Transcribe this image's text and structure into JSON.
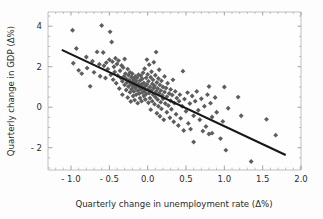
{
  "chart_data": {
    "type": "scatter",
    "title": "",
    "xlabel": "Quarterly change in unemployment rate (Δ%)",
    "ylabel": "Quarterly change in GDP (Δ%)",
    "xlim": [
      -1.3,
      2.0
    ],
    "ylim": [
      -3.1,
      4.7
    ],
    "grid": false,
    "legend": null,
    "xticks": [
      -1.0,
      -0.5,
      0.0,
      0.5,
      1.0,
      1.5,
      2.0
    ],
    "xtick_labels": [
      "- 1.0",
      "- 0.5",
      "0.0",
      "0.5",
      "1.0",
      "1.5",
      "2.0"
    ],
    "yticks": [
      -2,
      0,
      2,
      4
    ],
    "ytick_labels": [
      "- 2",
      "0",
      "2",
      "4"
    ],
    "marker_shape": "diamond",
    "marker_color": "#5d5d5d",
    "trendline": {
      "color": "#171717",
      "x1": -1.12,
      "y1": 2.83,
      "x2": 1.8,
      "y2": -2.36
    },
    "points": [
      [
        -0.98,
        3.8
      ],
      [
        -0.93,
        2.9
      ],
      [
        -0.97,
        2.17
      ],
      [
        -0.9,
        1.82
      ],
      [
        -0.86,
        1.66
      ],
      [
        -0.8,
        2.48
      ],
      [
        -0.79,
        1.93
      ],
      [
        -0.75,
        1.03
      ],
      [
        -0.72,
        2.27
      ],
      [
        -0.7,
        1.72
      ],
      [
        -0.66,
        2.73
      ],
      [
        -0.63,
        2.12
      ],
      [
        -0.62,
        1.53
      ],
      [
        -0.6,
        4.03
      ],
      [
        -0.58,
        2.7
      ],
      [
        -0.57,
        2.05
      ],
      [
        -0.55,
        1.44
      ],
      [
        -0.54,
        2.2
      ],
      [
        -0.52,
        1.88
      ],
      [
        -0.5,
        2.34
      ],
      [
        -0.49,
        3.72
      ],
      [
        -0.48,
        1.6
      ],
      [
        -0.47,
        3.22
      ],
      [
        -0.46,
        2.25
      ],
      [
        -0.45,
        1.36
      ],
      [
        -0.44,
        2.0
      ],
      [
        -0.43,
        1.74
      ],
      [
        -0.42,
        2.42
      ],
      [
        -0.41,
        1.18
      ],
      [
        -0.4,
        2.13
      ],
      [
        -0.39,
        1.57
      ],
      [
        -0.38,
        2.3
      ],
      [
        -0.37,
        0.92
      ],
      [
        -0.36,
        1.8
      ],
      [
        -0.35,
        1.45
      ],
      [
        -0.34,
        2.06
      ],
      [
        -0.33,
        1.28
      ],
      [
        -0.33,
        0.62
      ],
      [
        -0.32,
        1.96
      ],
      [
        -0.31,
        1.52
      ],
      [
        -0.3,
        1.1
      ],
      [
        -0.3,
        2.38
      ],
      [
        -0.29,
        1.66
      ],
      [
        -0.28,
        0.85
      ],
      [
        -0.28,
        1.4
      ],
      [
        -0.27,
        1.22
      ],
      [
        -0.26,
        1.88
      ],
      [
        -0.26,
        0.48
      ],
      [
        -0.25,
        1.58
      ],
      [
        -0.25,
        1.02
      ],
      [
        -0.24,
        1.33
      ],
      [
        -0.23,
        0.74
      ],
      [
        -0.23,
        1.72
      ],
      [
        -0.22,
        1.14
      ],
      [
        -0.22,
        0.28
      ],
      [
        -0.21,
        1.48
      ],
      [
        -0.21,
        0.9
      ],
      [
        -0.2,
        1.25
      ],
      [
        -0.2,
        1.65
      ],
      [
        -0.19,
        0.55
      ],
      [
        -0.19,
        1.05
      ],
      [
        -0.18,
        1.38
      ],
      [
        -0.18,
        0.78
      ],
      [
        -0.17,
        1.18
      ],
      [
        -0.17,
        0.35
      ],
      [
        -0.16,
        1.52
      ],
      [
        -0.16,
        0.95
      ],
      [
        -0.15,
        1.28
      ],
      [
        -0.15,
        0.62
      ],
      [
        -0.14,
        1.08
      ],
      [
        -0.14,
        1.45
      ],
      [
        -0.13,
        0.82
      ],
      [
        -0.13,
        0.2
      ],
      [
        -0.12,
        1.15
      ],
      [
        -0.12,
        1.6
      ],
      [
        -0.11,
        0.68
      ],
      [
        -0.11,
        1.0
      ],
      [
        -0.1,
        1.32
      ],
      [
        -0.1,
        0.45
      ],
      [
        -0.09,
        0.88
      ],
      [
        -0.09,
        1.55
      ],
      [
        -0.08,
        1.12
      ],
      [
        -0.08,
        0.3
      ],
      [
        -0.07,
        0.72
      ],
      [
        -0.07,
        1.4
      ],
      [
        -0.06,
        0.96
      ],
      [
        -0.06,
        1.7
      ],
      [
        -0.05,
        0.55
      ],
      [
        -0.05,
        1.2
      ],
      [
        -0.04,
        0.8
      ],
      [
        -0.04,
        1.9
      ],
      [
        -0.03,
        1.05
      ],
      [
        -0.03,
        0.38
      ],
      [
        -0.02,
        1.45
      ],
      [
        -0.02,
        0.65
      ],
      [
        -0.01,
        1.12
      ],
      [
        -0.01,
        2.35
      ],
      [
        0.0,
        0.88
      ],
      [
        0.0,
        1.62
      ],
      [
        0.01,
        0.22
      ],
      [
        0.01,
        1.28
      ],
      [
        0.02,
        0.7
      ],
      [
        0.02,
        2.1
      ],
      [
        0.03,
        1.0
      ],
      [
        0.03,
        0.45
      ],
      [
        0.04,
        1.48
      ],
      [
        0.04,
        -0.12
      ],
      [
        0.05,
        0.82
      ],
      [
        0.05,
        1.75
      ],
      [
        0.06,
        1.15
      ],
      [
        0.06,
        0.3
      ],
      [
        0.07,
        0.62
      ],
      [
        0.07,
        1.35
      ],
      [
        0.08,
        0.95
      ],
      [
        0.08,
        2.22
      ],
      [
        0.09,
        0.15
      ],
      [
        0.09,
        1.05
      ],
      [
        0.1,
        0.5
      ],
      [
        0.1,
        1.58
      ],
      [
        0.11,
        2.72
      ],
      [
        0.11,
        0.78
      ],
      [
        0.12,
        1.22
      ],
      [
        0.12,
        -0.3
      ],
      [
        0.13,
        0.38
      ],
      [
        0.13,
        0.92
      ],
      [
        0.14,
        1.42
      ],
      [
        0.14,
        0.05
      ],
      [
        0.15,
        0.68
      ],
      [
        0.15,
        1.85
      ],
      [
        0.16,
        1.1
      ],
      [
        0.16,
        -0.45
      ],
      [
        0.17,
        0.25
      ],
      [
        0.17,
        0.82
      ],
      [
        0.18,
        1.3
      ],
      [
        0.18,
        -0.08
      ],
      [
        0.19,
        0.58
      ],
      [
        0.2,
        1.0
      ],
      [
        0.2,
        0.42
      ],
      [
        0.21,
        -0.62
      ],
      [
        0.22,
        0.75
      ],
      [
        0.22,
        1.52
      ],
      [
        0.23,
        0.18
      ],
      [
        0.24,
        0.95
      ],
      [
        0.25,
        -0.25
      ],
      [
        0.25,
        0.52
      ],
      [
        0.26,
        1.18
      ],
      [
        0.27,
        0.08
      ],
      [
        0.28,
        0.68
      ],
      [
        0.29,
        -0.52
      ],
      [
        0.3,
        0.88
      ],
      [
        0.3,
        0.32
      ],
      [
        0.31,
        -0.1
      ],
      [
        0.32,
        0.6
      ],
      [
        0.33,
        1.35
      ],
      [
        0.34,
        -0.72
      ],
      [
        0.35,
        0.2
      ],
      [
        0.36,
        0.78
      ],
      [
        0.37,
        -0.35
      ],
      [
        0.38,
        0.45
      ],
      [
        0.4,
        -0.9
      ],
      [
        0.41,
        0.3
      ],
      [
        0.42,
        0.62
      ],
      [
        0.43,
        -0.55
      ],
      [
        0.45,
        0.05
      ],
      [
        0.46,
        1.78
      ],
      [
        0.47,
        -1.15
      ],
      [
        0.48,
        0.4
      ],
      [
        0.5,
        -0.2
      ],
      [
        0.52,
        0.72
      ],
      [
        0.53,
        -0.8
      ],
      [
        0.55,
        0.18
      ],
      [
        0.56,
        -1.08
      ],
      [
        0.58,
        0.55
      ],
      [
        0.6,
        -0.42
      ],
      [
        0.6,
        -1.72
      ],
      [
        0.62,
        0.3
      ],
      [
        0.64,
        0.78
      ],
      [
        0.66,
        -0.15
      ],
      [
        0.68,
        -0.62
      ],
      [
        0.7,
        0.42
      ],
      [
        0.72,
        -1.18
      ],
      [
        0.74,
        0.05
      ],
      [
        0.76,
        -0.95
      ],
      [
        0.78,
        0.62
      ],
      [
        0.8,
        1.02
      ],
      [
        0.8,
        -1.32
      ],
      [
        0.82,
        0.2
      ],
      [
        0.84,
        -0.48
      ],
      [
        0.84,
        -1.28
      ],
      [
        0.88,
        0.48
      ],
      [
        0.9,
        -0.25
      ],
      [
        0.95,
        -1.55
      ],
      [
        0.98,
        -0.7
      ],
      [
        1.0,
        1.0
      ],
      [
        1.02,
        -2.12
      ],
      [
        1.05,
        -0.05
      ],
      [
        1.18,
        0.5
      ],
      [
        1.22,
        -0.42
      ],
      [
        1.35,
        -2.68
      ],
      [
        1.55,
        -0.6
      ],
      [
        1.67,
        -1.38
      ]
    ]
  }
}
